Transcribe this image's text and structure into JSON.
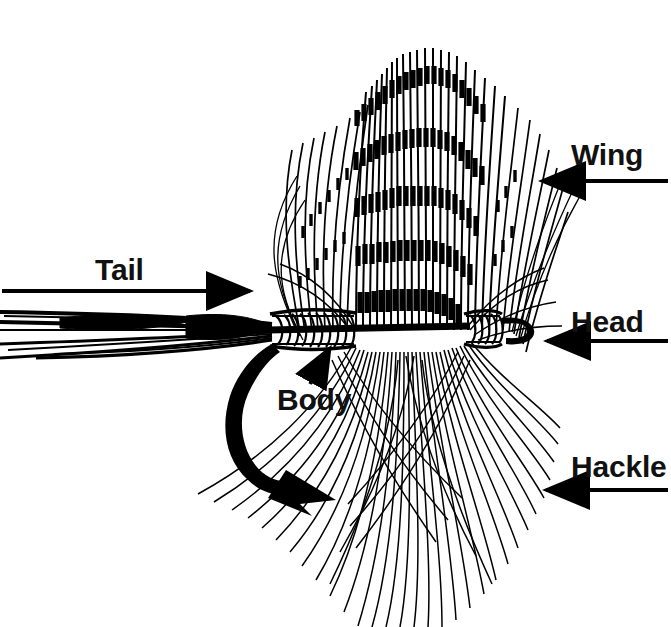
{
  "figure": {
    "style": "black-and-white line drawing",
    "background_color": "#ffffff",
    "ink_color": "#000000",
    "width": 671,
    "height": 627
  },
  "labels": {
    "wing": {
      "text": "Wing",
      "arrow_direction": "left",
      "points_to": "feather-wing"
    },
    "head": {
      "text": "Head",
      "arrow_direction": "left",
      "points_to": "thread-head-and-hook-eye"
    },
    "hackle": {
      "text": "Hackle",
      "arrow_direction": "left",
      "points_to": "hackle-fibers"
    },
    "tail": {
      "text": "Tail",
      "arrow_direction": "right",
      "points_to": "tail-fibers"
    },
    "body": {
      "text": "Body",
      "arrow_direction": "up-right",
      "points_to": "wrapped-body"
    }
  },
  "parts": [
    {
      "name": "wing",
      "label": "Wing"
    },
    {
      "name": "head",
      "label": "Head"
    },
    {
      "name": "hackle",
      "label": "Hackle"
    },
    {
      "name": "tail",
      "label": "Tail"
    },
    {
      "name": "body",
      "label": "Body"
    }
  ]
}
